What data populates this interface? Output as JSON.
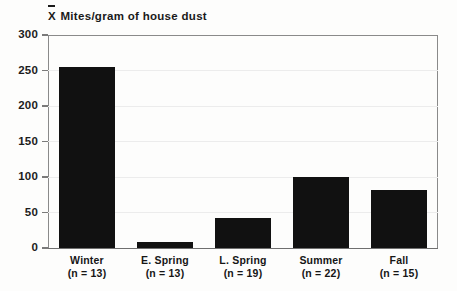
{
  "chart_data": {
    "type": "bar",
    "title_prefix": "X",
    "title_rest": " Mites/gram of house dust",
    "xlabel": "",
    "ylabel": "",
    "ylim": [
      0,
      300
    ],
    "yticks": [
      0,
      50,
      100,
      150,
      200,
      250,
      300
    ],
    "grid": true,
    "legend": "none",
    "categories": [
      "Winter",
      "E. Spring",
      "L. Spring",
      "Summer",
      "Fall"
    ],
    "values": [
      255,
      9,
      42,
      100,
      82
    ],
    "sample_sizes": [
      "(n = 13)",
      "(n = 13)",
      "(n = 19)",
      "(n = 22)",
      "(n = 15)"
    ],
    "bar_color": "#111111",
    "grid_color": "#ececec",
    "axis_color": "#7a7a7a"
  }
}
